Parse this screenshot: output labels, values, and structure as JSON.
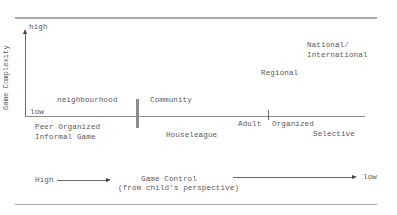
{
  "diagram": {
    "y_axis": {
      "label": "Game Complexity",
      "high": "high",
      "low": "low"
    },
    "stages": {
      "neighbourhood": "neighbourhood",
      "community": "Community",
      "regional": "Regional",
      "national_line1": "National/",
      "national_line2": "International"
    },
    "categories": {
      "peer_line1": "Peer Organized",
      "peer_line2": "Informal Game",
      "houseleague": "Houseleague",
      "adult": "Adult",
      "organized": "Organized",
      "selective": "Selective"
    },
    "x_axis": {
      "high": "High",
      "title_line1": "Game Control",
      "title_line2": "(from child's perspective)",
      "low": "low"
    }
  }
}
